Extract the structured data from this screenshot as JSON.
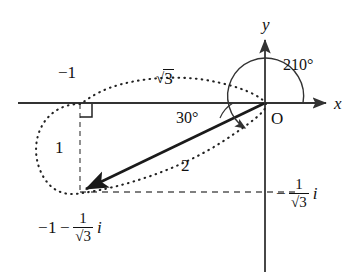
{
  "figure": {
    "type": "complex-plane-diagram",
    "axes": {
      "x_label": "x",
      "y_label": "y",
      "origin_label": "O"
    },
    "labels": {
      "point_real": "−1",
      "modulus_outer": "√3",
      "side_vertical": "1",
      "vector_length": "2",
      "angle_inner": "30°",
      "angle_outer": "210°",
      "point_full": {
        "real": "−1",
        "operator": "−",
        "fraction_num": "1",
        "fraction_den": "√3",
        "imaginary_unit": "i"
      },
      "imag_axis_value": {
        "operator": "−",
        "fraction_num": "1",
        "fraction_den": "√3",
        "imaginary_unit": "i"
      }
    },
    "angle_values": {
      "inner_degrees": 30,
      "outer_degrees": 210
    },
    "geometry": {
      "origin": [
        265,
        103
      ],
      "point": [
        80,
        192
      ],
      "vector_magnitude": 2,
      "adjacent_leg": "√3",
      "opposite_leg": 1
    },
    "colors": {
      "stroke": "#333333",
      "ink": "#111111",
      "dash": "#555555",
      "dot": "#222222",
      "background": "#ffffff"
    }
  }
}
